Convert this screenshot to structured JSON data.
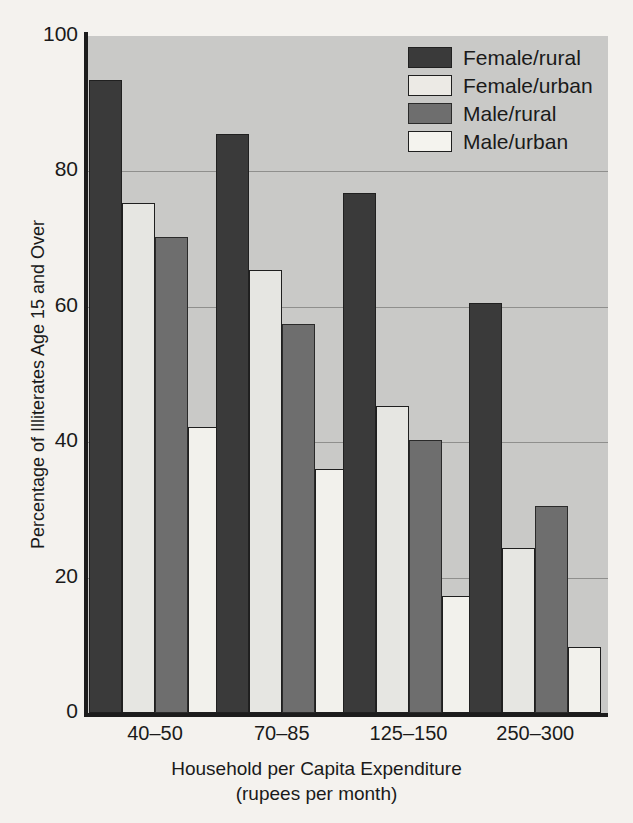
{
  "chart_data": {
    "type": "bar",
    "title": "",
    "xlabel": "Household per Capita Expenditure",
    "xlabel_sub": "(rupees per month)",
    "ylabel": "Percentage of Illiterates Age 15 and Over",
    "categories": [
      "40–50",
      "70–85",
      "125–150",
      "250–300"
    ],
    "ylim": [
      0,
      100
    ],
    "yticks": [
      0,
      20,
      40,
      60,
      80,
      100
    ],
    "ytick_labels": [
      "0",
      "20",
      "40",
      "60",
      "80",
      "100"
    ],
    "grid": "horizontal",
    "legend_position": "top-right",
    "series": [
      {
        "name": "Female/rural",
        "color": "#3a3a3a",
        "values": [
          93.5,
          85.5,
          76.8,
          60.6
        ]
      },
      {
        "name": "Female/urban",
        "color": "#e6e6e2",
        "values": [
          75.3,
          65.4,
          45.3,
          24.4
        ]
      },
      {
        "name": "Male/rural",
        "color": "#6e6e6e",
        "values": [
          70.3,
          57.5,
          40.3,
          30.6
        ]
      },
      {
        "name": "Male/urban",
        "color": "#f2f1ec",
        "values": [
          42.3,
          36.1,
          17.3,
          9.8
        ]
      }
    ]
  },
  "figure": {
    "background_color": "#f4f2ee",
    "plot_background_color": "#c9c9c7",
    "gridline_color": "#8f8f8d",
    "axis_color": "#1c1c1c"
  }
}
